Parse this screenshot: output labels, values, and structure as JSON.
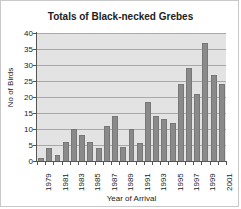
{
  "chart_data": {
    "type": "bar",
    "title": "Totals of Black-necked Grebes",
    "xlabel": "Year of Arrival",
    "ylabel": "No of Birds",
    "ylim": [
      0,
      40
    ],
    "ytick_step": 5,
    "yticks": [
      "40",
      "35",
      "30",
      "25",
      "20",
      "15",
      "10",
      "5",
      "0"
    ],
    "grid": true,
    "legend": "none",
    "bar_color": "#8a8a8a",
    "plot_background": "#e3e3e3",
    "axis_color": "#555555",
    "gridline_color": "#a8a8a8",
    "categories": [
      "1979",
      "1980",
      "1981",
      "1982",
      "1983",
      "1984",
      "1985",
      "1986",
      "1987",
      "1988",
      "1989",
      "1990",
      "1991",
      "1992",
      "1993",
      "1994",
      "1995",
      "1996",
      "1997",
      "1998",
      "1999",
      "2000",
      "2001"
    ],
    "tick_labels_shown": [
      "1979",
      "1981",
      "1983",
      "1985",
      "1987",
      "1989",
      "1991",
      "1993",
      "1995",
      "1997",
      "1999",
      "2001"
    ],
    "values": [
      1,
      4,
      2,
      6,
      10,
      8,
      6,
      4,
      11,
      14,
      4.5,
      10,
      5.5,
      18.5,
      14,
      13,
      12,
      24,
      29,
      21,
      37,
      27,
      24
    ]
  }
}
